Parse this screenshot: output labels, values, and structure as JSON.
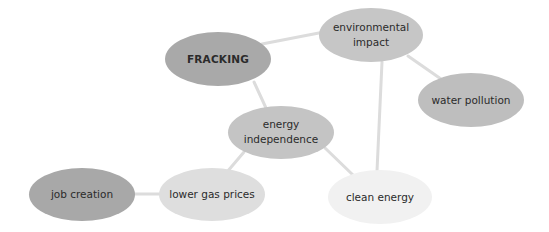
{
  "diagram": {
    "type": "concept-map",
    "background": "#ffffff",
    "edge_color": "#dcdcdc",
    "nodes": [
      {
        "id": "fracking",
        "label": "FRACKING",
        "cx": 218,
        "cy": 59,
        "w": 106,
        "h": 54,
        "fill": "#a9a9a9",
        "bold": true
      },
      {
        "id": "environmental-impact",
        "label": "environmental\nimpact",
        "cx": 371,
        "cy": 35,
        "w": 104,
        "h": 54,
        "fill": "#c6c6c6",
        "bold": false
      },
      {
        "id": "water-pollution",
        "label": "water pollution",
        "cx": 471,
        "cy": 100,
        "w": 106,
        "h": 54,
        "fill": "#bebebe",
        "bold": false
      },
      {
        "id": "energy-independence",
        "label": "energy\nindependence",
        "cx": 281,
        "cy": 132,
        "w": 106,
        "h": 53,
        "fill": "#c4c4c4",
        "bold": false
      },
      {
        "id": "job-creation",
        "label": "job creation",
        "cx": 82,
        "cy": 194,
        "w": 106,
        "h": 53,
        "fill": "#a8a8a8",
        "bold": false
      },
      {
        "id": "lower-gas-prices",
        "label": "lower gas prices",
        "cx": 212,
        "cy": 194,
        "w": 106,
        "h": 53,
        "fill": "#dedede",
        "bold": false
      },
      {
        "id": "clean-energy",
        "label": "clean energy",
        "cx": 380,
        "cy": 197,
        "w": 104,
        "h": 54,
        "fill": "#f1f1f1",
        "bold": false
      }
    ],
    "edges": [
      {
        "from": "fracking",
        "to": "environmental-impact",
        "x1": 262,
        "y1": 44,
        "x2": 324,
        "y2": 32
      },
      {
        "from": "fracking",
        "to": "energy-independence",
        "x1": 254,
        "y1": 82,
        "x2": 266,
        "y2": 108
      },
      {
        "from": "environmental-impact",
        "to": "water-pollution",
        "x1": 408,
        "y1": 56,
        "x2": 441,
        "y2": 79
      },
      {
        "from": "environmental-impact",
        "to": "clean-energy",
        "x1": 382,
        "y1": 62,
        "x2": 377,
        "y2": 171
      },
      {
        "from": "energy-independence",
        "to": "lower-gas-prices",
        "x1": 244,
        "y1": 152,
        "x2": 227,
        "y2": 172
      },
      {
        "from": "energy-independence",
        "to": "clean-energy",
        "x1": 325,
        "y1": 148,
        "x2": 353,
        "y2": 175
      },
      {
        "from": "job-creation",
        "to": "lower-gas-prices",
        "x1": 134,
        "y1": 194,
        "x2": 160,
        "y2": 194
      }
    ]
  }
}
